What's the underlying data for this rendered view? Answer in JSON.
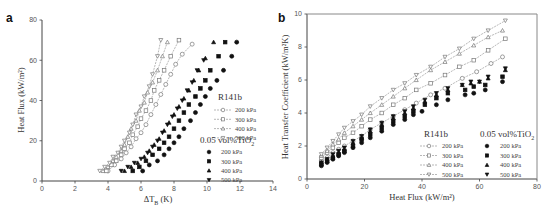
{
  "chart_data": [
    {
      "panel": "a",
      "type": "scatter",
      "title": "",
      "xlabel": "ΔT_B (K)",
      "ylabel": "Heat Flux (kW/m²)",
      "xlim": [
        0,
        14
      ],
      "ylim": [
        0,
        80
      ],
      "xticks": [
        "0",
        "2",
        "4",
        "6",
        "8",
        "10",
        "12",
        "14"
      ],
      "yticks": [
        "0",
        "20",
        "40",
        "60",
        "80"
      ],
      "grid": false,
      "legend_position": "lower right",
      "legend_groups": [
        {
          "title": "R141b",
          "entries": [
            "200 kPa",
            "300 kPa",
            "400 kPa",
            "500 kPa"
          ]
        },
        {
          "title": "0.05 vol%TiO₂",
          "entries": [
            "200 kPa",
            "300 kPa",
            "400 kPa",
            "500 kPa"
          ]
        }
      ],
      "series": [
        {
          "name": "R141b 200 kPa",
          "marker": "open-circle",
          "line": true,
          "x": [
            4.0,
            4.4,
            4.8,
            5.1,
            5.4,
            5.7,
            6.0,
            6.3,
            6.6,
            6.9,
            7.2,
            7.5,
            7.8,
            8.1,
            8.5,
            9.1
          ],
          "y": [
            5,
            8,
            11,
            14,
            17,
            21,
            24,
            28,
            33,
            38,
            43,
            48,
            53,
            58,
            63,
            68
          ]
        },
        {
          "name": "R141b 300 kPa",
          "marker": "open-square",
          "line": true,
          "x": [
            3.9,
            4.2,
            4.5,
            4.8,
            5.0,
            5.3,
            5.5,
            5.8,
            6.0,
            6.3,
            6.6,
            6.8,
            7.1,
            7.4,
            7.8,
            8.3
          ],
          "y": [
            5,
            8,
            10,
            13,
            16,
            19,
            23,
            27,
            31,
            35,
            40,
            45,
            50,
            55,
            62,
            70
          ]
        },
        {
          "name": "R141b 400 kPa",
          "marker": "open-triangle",
          "line": true,
          "x": [
            3.7,
            4.0,
            4.3,
            4.5,
            4.8,
            5.0,
            5.2,
            5.4,
            5.7,
            5.9,
            6.2,
            6.4,
            6.7,
            7.0,
            7.3,
            7.6
          ],
          "y": [
            5,
            7,
            10,
            12,
            15,
            18,
            22,
            26,
            30,
            35,
            39,
            44,
            49,
            55,
            62,
            69
          ]
        },
        {
          "name": "R141b 500 kPa",
          "marker": "open-inverted-triangle",
          "line": true,
          "x": [
            3.5,
            3.8,
            4.1,
            4.3,
            4.6,
            4.8,
            5.0,
            5.3,
            5.5,
            5.7,
            6.0,
            6.2,
            6.5,
            6.7,
            7.0,
            7.2
          ],
          "y": [
            5,
            7,
            9,
            12,
            14,
            17,
            20,
            24,
            28,
            33,
            37,
            42,
            47,
            53,
            62,
            70
          ]
        },
        {
          "name": "0.05 vol%TiO₂ 200 kPa",
          "marker": "filled-circle",
          "line": false,
          "x": [
            6.1,
            6.5,
            7.0,
            7.4,
            7.7,
            8.0,
            8.3,
            8.6,
            9.0,
            9.3,
            9.6,
            9.9,
            10.2,
            10.6,
            11.0,
            11.5,
            11.8
          ],
          "y": [
            5,
            8,
            10,
            13,
            16,
            19,
            22,
            26,
            30,
            34,
            38,
            42,
            46,
            50,
            55,
            62,
            69
          ]
        },
        {
          "name": "0.05 vol%TiO₂ 300 kPa",
          "marker": "filled-square",
          "line": false,
          "x": [
            5.5,
            5.9,
            6.3,
            6.7,
            7.1,
            7.4,
            7.7,
            8.0,
            8.3,
            8.6,
            8.9,
            9.3,
            9.6,
            9.9,
            10.2,
            10.7,
            11.1
          ],
          "y": [
            5,
            7,
            10,
            13,
            16,
            19,
            22,
            26,
            30,
            34,
            38,
            42,
            46,
            50,
            55,
            62,
            69
          ]
        },
        {
          "name": "0.05 vol%TiO₂ 400 kPa",
          "marker": "filled-triangle",
          "line": false,
          "x": [
            5.0,
            5.4,
            5.8,
            6.2,
            6.5,
            6.8,
            7.1,
            7.4,
            7.7,
            8.0,
            8.3,
            8.6,
            8.9,
            9.2,
            9.5,
            9.9,
            10.4
          ],
          "y": [
            5,
            7,
            9,
            12,
            15,
            18,
            21,
            25,
            29,
            33,
            37,
            41,
            45,
            50,
            55,
            61,
            69
          ]
        },
        {
          "name": "0.05 vol%TiO₂ 500 kPa",
          "marker": "filled-inverted-triangle",
          "line": false,
          "x": [
            4.8,
            5.2,
            5.6,
            6.0,
            6.4,
            6.7,
            7.0,
            7.3,
            7.6,
            7.9,
            8.2,
            8.5,
            8.8,
            9.1,
            9.4,
            9.8
          ],
          "y": [
            5,
            7,
            9,
            11,
            14,
            17,
            20,
            24,
            28,
            32,
            36,
            40,
            45,
            49,
            55,
            60
          ]
        }
      ]
    },
    {
      "panel": "b",
      "type": "scatter",
      "title": "",
      "xlabel": "Heat Flux (kW/m²)",
      "ylabel": "Heat Transfer Coefficient (kW/m²K)",
      "xlim": [
        0,
        80
      ],
      "ylim": [
        0,
        10
      ],
      "xticks": [
        "0",
        "20",
        "40",
        "60",
        "80"
      ],
      "yticks": [
        "0",
        "2",
        "4",
        "6",
        "8",
        "10"
      ],
      "grid": false,
      "legend_position": "lower right",
      "legend_groups": [
        {
          "title": "R141b",
          "entries": [
            "200 kPa",
            "300 kPa",
            "400 kPa",
            "500 kPa"
          ]
        },
        {
          "title": "0.05 vol%TiO₂",
          "entries": [
            "200 kPa",
            "300 kPa",
            "400 kPa",
            "500 kPa"
          ]
        }
      ],
      "series": [
        {
          "name": "R141b 200 kPa",
          "marker": "open-circle",
          "line": true,
          "x": [
            5,
            7,
            9,
            11,
            13,
            16,
            19,
            22,
            26,
            30,
            34,
            38,
            43,
            48,
            54,
            59,
            64,
            68
          ],
          "y": [
            1.1,
            1.3,
            1.6,
            1.8,
            2.0,
            2.3,
            2.6,
            3.0,
            3.4,
            3.8,
            4.2,
            4.6,
            5.1,
            5.5,
            6.1,
            6.5,
            7.0,
            7.4
          ]
        },
        {
          "name": "R141b 300 kPa",
          "marker": "open-square",
          "line": true,
          "x": [
            5,
            7,
            9,
            11,
            13,
            16,
            19,
            22,
            26,
            30,
            34,
            38,
            43,
            48,
            53,
            58,
            63,
            69
          ],
          "y": [
            1.3,
            1.6,
            1.9,
            2.2,
            2.5,
            2.8,
            3.2,
            3.6,
            4.0,
            4.5,
            4.9,
            5.4,
            5.8,
            6.3,
            6.8,
            7.2,
            7.8,
            8.5
          ]
        },
        {
          "name": "R141b 400 kPa",
          "marker": "open-triangle",
          "line": true,
          "x": [
            5,
            7,
            9,
            11,
            13,
            16,
            19,
            22,
            26,
            30,
            34,
            38,
            43,
            48,
            53,
            58,
            63,
            68
          ],
          "y": [
            1.4,
            1.7,
            2.1,
            2.4,
            2.8,
            3.2,
            3.6,
            4.0,
            4.5,
            5.0,
            5.5,
            6.0,
            6.6,
            7.1,
            7.6,
            8.1,
            8.6,
            9.0
          ]
        },
        {
          "name": "R141b 500 kPa",
          "marker": "open-inverted-triangle",
          "line": true,
          "x": [
            5,
            7,
            9,
            11,
            13,
            16,
            19,
            22,
            26,
            30,
            34,
            38,
            43,
            48,
            53,
            58,
            63,
            69
          ],
          "y": [
            1.5,
            1.9,
            2.3,
            2.7,
            3.1,
            3.5,
            3.9,
            4.4,
            4.9,
            5.4,
            5.8,
            6.3,
            6.8,
            7.4,
            7.9,
            8.5,
            9.0,
            9.6
          ]
        },
        {
          "name": "0.05 vol%TiO₂ 200 kPa",
          "marker": "filled-circle",
          "line": false,
          "x": [
            5,
            7,
            9,
            11,
            13,
            16,
            19,
            22,
            26,
            30,
            34,
            37,
            40,
            45,
            49,
            55,
            58,
            62,
            68
          ],
          "y": [
            0.8,
            1.0,
            1.2,
            1.4,
            1.6,
            1.9,
            2.2,
            2.5,
            2.9,
            3.3,
            3.6,
            3.9,
            4.1,
            4.5,
            4.8,
            5.1,
            5.2,
            5.4,
            5.9
          ]
        },
        {
          "name": "0.05 vol%TiO₂ 300 kPa",
          "marker": "filled-square",
          "line": false,
          "x": [
            5,
            7,
            9,
            11,
            13,
            16,
            19,
            22,
            26,
            30,
            34,
            37,
            41,
            45,
            49,
            55,
            58,
            62,
            68
          ],
          "y": [
            0.9,
            1.1,
            1.3,
            1.5,
            1.7,
            2.0,
            2.4,
            2.7,
            3.1,
            3.5,
            3.8,
            4.1,
            4.5,
            4.9,
            5.2,
            5.4,
            5.6,
            5.7,
            6.2
          ]
        },
        {
          "name": "0.05 vol%TiO₂ 400 kPa",
          "marker": "filled-triangle",
          "line": false,
          "x": [
            5,
            7,
            9,
            11,
            13,
            16,
            19,
            22,
            26,
            30,
            34,
            37,
            41,
            45,
            49,
            54,
            57,
            60,
            63,
            69
          ],
          "y": [
            1.0,
            1.2,
            1.4,
            1.6,
            1.8,
            2.2,
            2.5,
            2.9,
            3.3,
            3.7,
            4.0,
            4.3,
            4.7,
            5.1,
            5.4,
            5.7,
            5.8,
            5.9,
            6.1,
            6.6
          ]
        },
        {
          "name": "0.05 vol%TiO₂ 500 kPa",
          "marker": "filled-inverted-triangle",
          "line": false,
          "x": [
            5,
            7,
            9,
            11,
            13,
            16,
            19,
            22,
            26,
            30,
            34,
            37,
            41,
            45,
            49,
            54,
            57,
            60,
            63,
            69
          ],
          "y": [
            1.0,
            1.2,
            1.5,
            1.7,
            1.9,
            2.3,
            2.6,
            3.0,
            3.4,
            3.8,
            4.1,
            4.4,
            4.8,
            5.2,
            5.5,
            5.7,
            5.9,
            5.9,
            6.2,
            6.7
          ]
        }
      ]
    }
  ],
  "panels": {
    "a": {
      "label": "a",
      "ylabel": "Heat Flux (kW/m²)",
      "xlabel": "ΔT",
      "xlabel_sub": "B",
      "xlabel_unit": " (K)",
      "legend": {
        "group1_title": "R141b",
        "group2_title": "0.05 vol%TiO",
        "group2_sub": "2",
        "items": [
          "200 kPa",
          "300 kPa",
          "400 kPa",
          "500 kPa"
        ]
      }
    },
    "b": {
      "label": "b",
      "ylabel": "Heat Transfer Coefficient (kW/m²K)",
      "xlabel": "Heat Flux (kW/m²)",
      "legend": {
        "group1_title": "R141b",
        "group2_title": "0.05 vol%TiO",
        "group2_sub": "2",
        "items": [
          "200 kPa",
          "300 kPa",
          "400 kPa",
          "500 kPa"
        ]
      }
    }
  }
}
